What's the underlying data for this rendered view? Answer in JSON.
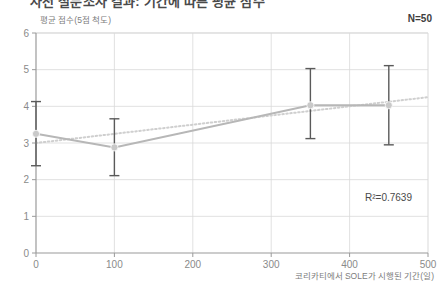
{
  "title": "사전 설문조사 결과: 기간에 따른 평균 점수",
  "y_axis_caption": "평균 점수(5점 척도)",
  "x_axis_caption": "코리카티에서 SOLE가 시행된 기간(일)",
  "sample_size_label": "N=50",
  "r_squared_label": "R²=0.7639",
  "colors": {
    "series_line": "#b7b7b7",
    "marker": "#c9c9c9",
    "error_bar": "#5a5a5a",
    "trendline": "#cfcfcf",
    "gridline": "#d9d9d9",
    "axis": "#9a9a9a",
    "text": "#7d7d7d"
  },
  "chart_data": {
    "type": "line",
    "title": "사전 설문조사 결과: 기간에 따른 평균 점수",
    "xlabel": "코리카티에서 SOLE가 시행된 기간(일)",
    "ylabel": "평균 점수(5점 척도)",
    "xlim": [
      0,
      500
    ],
    "ylim": [
      0,
      6
    ],
    "xticks": [
      0,
      100,
      200,
      300,
      400,
      500
    ],
    "yticks": [
      0,
      1,
      2,
      3,
      4,
      5,
      6
    ],
    "grid": true,
    "legend": "none",
    "x": [
      0,
      100,
      350,
      450
    ],
    "series": [
      {
        "name": "평균 점수",
        "values": [
          3.25,
          2.88,
          4.03,
          4.03
        ],
        "error_upper": [
          4.13,
          3.66,
          5.03,
          5.11
        ],
        "error_lower": [
          2.38,
          2.11,
          3.12,
          2.95
        ]
      }
    ],
    "trendline": {
      "type": "linear",
      "x": [
        0,
        500
      ],
      "y": [
        3.0,
        4.25
      ],
      "style": "dotted",
      "r_squared": 0.7639,
      "r_squared_label": "R²=0.7639"
    },
    "annotations": [
      {
        "text": "N=50",
        "position": "top-right"
      },
      {
        "text": "R²=0.7639",
        "position": "inside-bottom-right"
      }
    ],
    "sample_size": 50
  }
}
